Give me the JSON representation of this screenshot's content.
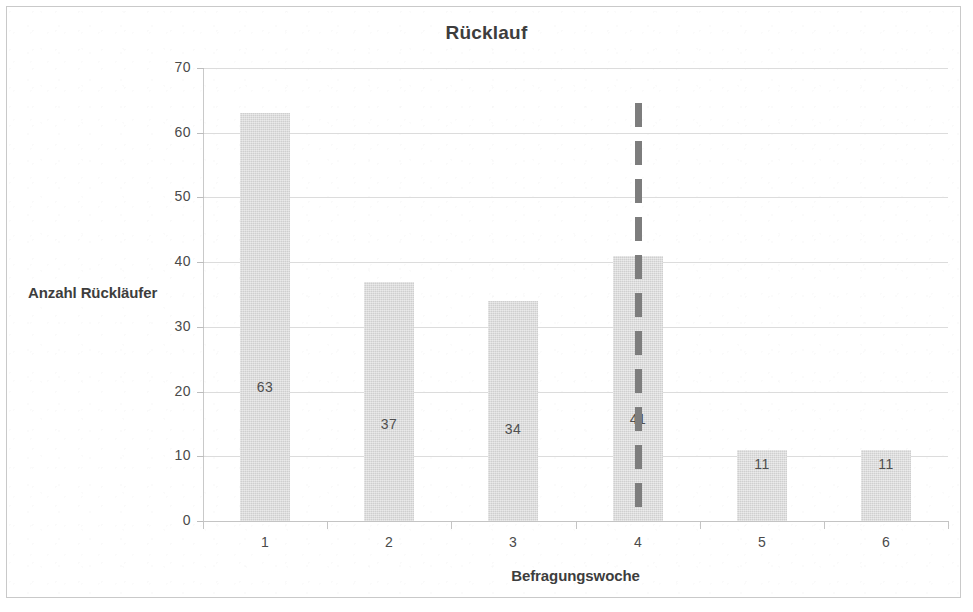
{
  "chart_data": {
    "type": "bar",
    "title": "Rücklauf",
    "xlabel": "Befragungswoche",
    "ylabel": "Anzahl Rückläufer",
    "categories": [
      "1",
      "2",
      "3",
      "4",
      "5",
      "6"
    ],
    "values": [
      63,
      37,
      34,
      41,
      11,
      11
    ],
    "data_labels": [
      "63",
      "37",
      "34",
      "41",
      "11",
      "11"
    ],
    "ylim": [
      0,
      70
    ],
    "ytick_labels": [
      "70",
      "60",
      "50",
      "40",
      "30",
      "20",
      "10",
      "0"
    ],
    "ytick_values": [
      70,
      60,
      50,
      40,
      30,
      20,
      10,
      0
    ],
    "grid": true,
    "legend": "none",
    "bar_color": "#d8d8d8",
    "gridline_color": "#dcdcdc",
    "text_color": "#3d3d3d",
    "annotations": [
      {
        "name": "divider",
        "type": "vertical-dashed-line",
        "between_categories": [
          "3",
          "4"
        ],
        "x_value": 3.5,
        "color": "#7d7d7d",
        "style": "dashed"
      }
    ]
  }
}
